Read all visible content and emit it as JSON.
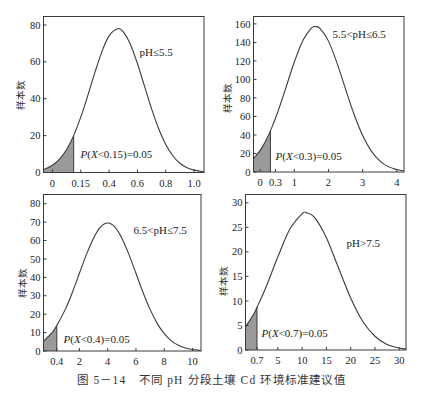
{
  "caption": "图 5－14　不同 pH 分段土壤 Cd 环境标准建议值",
  "colors": {
    "curve": "#3a3a3a",
    "axis": "#3a3a3a",
    "shade": "#9a9a9a",
    "text": "#222222"
  },
  "chart_data": [
    {
      "type": "area",
      "title": "pH≤5.5",
      "annotation": "P(X<0.15)=0.05",
      "threshold": 0.15,
      "probability": 0.05,
      "xlabel": "",
      "ylabel": "样本数",
      "xlim": [
        -0.063,
        1.07
      ],
      "ylim": [
        0,
        84.6
      ],
      "grid": false,
      "yticks": [
        0,
        20,
        40,
        60,
        80
      ],
      "xticks": [
        {
          "pos": 0,
          "label": "0"
        },
        {
          "pos": 0.2,
          "label": "0.15"
        },
        {
          "pos": 0.4,
          "label": "0.4"
        },
        {
          "pos": 0.6,
          "label": "0.6"
        },
        {
          "pos": 0.8,
          "label": "0.8"
        },
        {
          "pos": 1.0,
          "label": "1.0"
        }
      ],
      "x": [
        -0.06,
        0,
        0.05,
        0.1,
        0.15,
        0.2,
        0.25,
        0.3,
        0.35,
        0.4,
        0.46,
        0.5,
        0.55,
        0.6,
        0.65,
        0.7,
        0.75,
        0.8,
        0.85,
        0.9,
        0.95,
        1.0,
        1.07
      ],
      "y": [
        1.7,
        3.9,
        7.2,
        12.5,
        20.0,
        30.0,
        41.8,
        54.3,
        65.7,
        74.1,
        78.0,
        76.3,
        69.6,
        59.1,
        46.8,
        34.5,
        23.7,
        15.2,
        9.1,
        5.0,
        2.6,
        1.3,
        0.4
      ]
    },
    {
      "type": "area",
      "title": "5.5<pH≤6.5",
      "annotation": "P(X<0.3)=0.05",
      "threshold": 0.3,
      "probability": 0.05,
      "xlabel": "",
      "ylabel": "样本数",
      "xlim": [
        -0.195,
        4.21
      ],
      "ylim": [
        0,
        168
      ],
      "grid": false,
      "yticks": [
        0,
        20,
        40,
        60,
        80,
        100,
        120,
        140,
        160
      ],
      "xticks": [
        {
          "pos": 0,
          "label": "0"
        },
        {
          "pos": 0.45,
          "label": "0.3"
        },
        {
          "pos": 1,
          "label": "1"
        },
        {
          "pos": 2,
          "label": "2"
        },
        {
          "pos": 3,
          "label": "3"
        },
        {
          "pos": 4,
          "label": "4"
        }
      ],
      "x": [
        -0.2,
        0,
        0.15,
        0.3,
        0.5,
        0.75,
        1.0,
        1.25,
        1.5,
        1.62,
        1.75,
        2.0,
        2.25,
        2.5,
        2.75,
        3.0,
        3.25,
        3.5,
        3.75,
        4.0,
        4.2
      ],
      "y": [
        14.2,
        23.4,
        32.7,
        44.4,
        63.2,
        90.7,
        118.8,
        142.1,
        155.4,
        157.0,
        155.1,
        141.4,
        117.7,
        89.5,
        62.1,
        39.4,
        22.8,
        12.1,
        5.8,
        2.6,
        1.2
      ]
    },
    {
      "type": "area",
      "title": "6.5<pH≤7.5",
      "annotation": "P(X<0.4)=0.05",
      "threshold": 0.4,
      "probability": 0.05,
      "xlabel": "",
      "ylabel": "样本数",
      "xlim": [
        -0.54,
        10.6
      ],
      "ylim": [
        0,
        85
      ],
      "grid": false,
      "yticks": [
        0,
        10,
        20,
        30,
        40,
        50,
        60,
        70,
        80
      ],
      "xticks": [
        {
          "pos": 0.4,
          "label": "0.4"
        },
        {
          "pos": 2,
          "label": "2"
        },
        {
          "pos": 4,
          "label": "4"
        },
        {
          "pos": 6,
          "label": "6"
        },
        {
          "pos": 8,
          "label": "8"
        },
        {
          "pos": 10,
          "label": "10"
        }
      ],
      "x": [
        -0.54,
        0,
        0.2,
        0.4,
        1,
        1.5,
        2,
        2.5,
        3,
        3.5,
        4,
        4.5,
        5,
        5.5,
        6,
        6.5,
        7,
        7.5,
        8,
        8.5,
        9,
        9.5,
        10,
        10.6
      ],
      "y": [
        5.3,
        9.4,
        11.4,
        13.8,
        22.6,
        31.8,
        42.2,
        52.5,
        61.3,
        67.4,
        69.5,
        67.4,
        61.3,
        52.5,
        42.2,
        31.8,
        22.6,
        15.0,
        9.4,
        5.5,
        3.1,
        1.6,
        0.8,
        0.3
      ]
    },
    {
      "type": "area",
      "title": "pH>7.5",
      "annotation": "P(X<0.7)=0.05",
      "threshold": 0.7,
      "probability": 0.05,
      "xlabel": "",
      "ylabel": "样本数",
      "xlim": [
        -1.67,
        31.4
      ],
      "ylim": [
        0,
        31.7
      ],
      "grid": false,
      "yticks": [
        0,
        5,
        10,
        15,
        20,
        25,
        30
      ],
      "xticks": [
        {
          "pos": 0.7,
          "label": "0.7"
        },
        {
          "pos": 5,
          "label": "5"
        },
        {
          "pos": 10,
          "label": "10"
        },
        {
          "pos": 15,
          "label": "15"
        },
        {
          "pos": 20,
          "label": "20"
        },
        {
          "pos": 25,
          "label": "25"
        },
        {
          "pos": 30,
          "label": "30"
        }
      ],
      "x": [
        -1.67,
        0,
        0.7,
        2.5,
        5,
        7.5,
        10,
        10.8,
        12.5,
        15,
        17.5,
        20,
        22.5,
        25,
        27.5,
        30,
        31.4
      ],
      "y": [
        4.7,
        7.3,
        8.7,
        12.7,
        19.0,
        24.7,
        27.8,
        28.0,
        27.1,
        22.9,
        16.7,
        10.6,
        5.8,
        2.8,
        1.1,
        0.4,
        0.2
      ]
    }
  ]
}
